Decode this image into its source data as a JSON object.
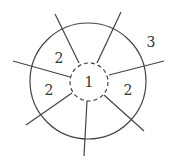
{
  "diagram": {
    "stroke_color": "#444444",
    "outer_circle": {
      "cx": 88,
      "cy": 81,
      "r": 58
    },
    "inner_circle": {
      "cx": 89,
      "cy": 82,
      "r": 19,
      "style": "dashed"
    },
    "lines": [
      {
        "x1": 79,
        "y1": 63,
        "x2": 55,
        "y2": 14
      },
      {
        "x1": 97,
        "y1": 63,
        "x2": 121,
        "y2": 12
      },
      {
        "x1": 109,
        "y1": 75,
        "x2": 164,
        "y2": 61
      },
      {
        "x1": 104,
        "y1": 95,
        "x2": 144,
        "y2": 131
      },
      {
        "x1": 87,
        "y1": 101,
        "x2": 84,
        "y2": 156
      },
      {
        "x1": 72,
        "y1": 93,
        "x2": 26,
        "y2": 125
      },
      {
        "x1": 70,
        "y1": 77,
        "x2": 13,
        "y2": 61
      }
    ],
    "labels": [
      {
        "text": "2",
        "x": 59,
        "y": 63
      },
      {
        "text": "2",
        "x": 49,
        "y": 95
      },
      {
        "text": "1",
        "x": 89,
        "y": 87
      },
      {
        "text": "2",
        "x": 128,
        "y": 95
      },
      {
        "text": "3",
        "x": 151,
        "y": 47
      }
    ]
  }
}
